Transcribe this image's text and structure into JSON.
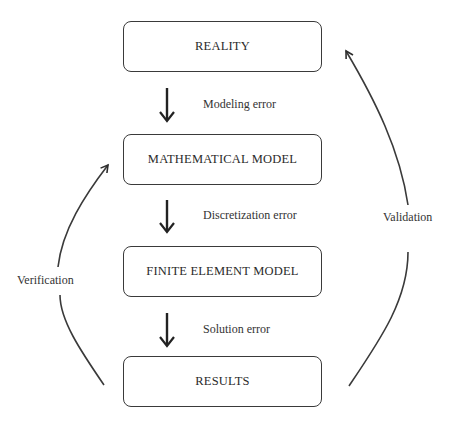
{
  "diagram": {
    "boxes": [
      {
        "id": "reality",
        "label": "REALITY"
      },
      {
        "id": "mathematical-model",
        "label": "MATHEMATICAL MODEL"
      },
      {
        "id": "finite-element-model",
        "label": "FINITE ELEMENT MODEL"
      },
      {
        "id": "results",
        "label": "RESULTS"
      }
    ],
    "arrows": [
      {
        "from": "reality",
        "to": "mathematical-model",
        "label": "Modeling error"
      },
      {
        "from": "mathematical-model",
        "to": "finite-element-model",
        "label": "Discretization error"
      },
      {
        "from": "finite-element-model",
        "to": "results",
        "label": "Solution error"
      }
    ],
    "loops": [
      {
        "from": "results",
        "to": "mathematical-model",
        "side": "left",
        "label": "Verification"
      },
      {
        "from": "results",
        "to": "reality",
        "side": "right",
        "label": "Validation"
      }
    ],
    "colors": {
      "stroke": "#3a3a3a",
      "text": "#2a2a2a",
      "background": "#ffffff"
    }
  }
}
